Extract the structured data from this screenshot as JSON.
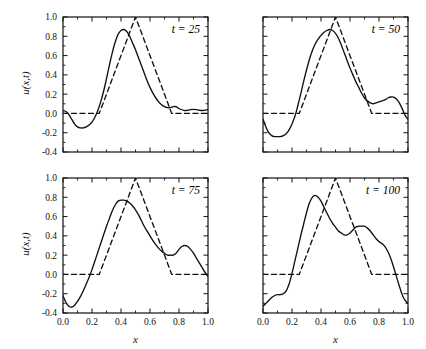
{
  "figure": {
    "axis_label_x": "x",
    "axis_label_y": "u(x,t)",
    "xticklabels": [
      "0.0",
      "0.2",
      "0.4",
      "0.6",
      "0.8",
      "1.0"
    ],
    "yticklabels": [
      "-0.4",
      "-0.2",
      "0.0",
      "0.2",
      "0.4",
      "0.6",
      "0.8",
      "1.0"
    ],
    "line_color": "#111111",
    "frame_color": "#111111",
    "background": "#ffffff"
  },
  "chart_data": {
    "type": "line",
    "title": "",
    "xlabel": "x",
    "ylabel": "u(x,t)",
    "xlim": [
      0.0,
      1.0
    ],
    "ylim": [
      -0.4,
      1.0
    ],
    "xticks": [
      0.0,
      0.2,
      0.4,
      0.6,
      0.8,
      1.0
    ],
    "yticks": [
      -0.4,
      -0.2,
      0.0,
      0.2,
      0.4,
      0.6,
      0.8,
      1.0
    ],
    "grid": false,
    "legend": null,
    "panels": [
      {
        "annotation": "t = 25",
        "position": "top-left",
        "series": [
          {
            "name": "numerical",
            "style": "solid",
            "x": [
              0.0,
              0.02,
              0.04,
              0.06,
              0.08,
              0.1,
              0.12,
              0.14,
              0.16,
              0.18,
              0.2,
              0.22,
              0.24,
              0.26,
              0.28,
              0.3,
              0.32,
              0.34,
              0.36,
              0.38,
              0.4,
              0.42,
              0.44,
              0.46,
              0.48,
              0.5,
              0.52,
              0.54,
              0.56,
              0.58,
              0.6,
              0.62,
              0.64,
              0.66,
              0.68,
              0.7,
              0.72,
              0.74,
              0.76,
              0.78,
              0.8,
              0.84,
              0.88,
              0.92,
              0.96,
              1.0
            ],
            "y": [
              0.03,
              0.02,
              -0.01,
              -0.06,
              -0.11,
              -0.14,
              -0.15,
              -0.15,
              -0.14,
              -0.12,
              -0.09,
              -0.04,
              0.03,
              0.12,
              0.23,
              0.36,
              0.5,
              0.63,
              0.74,
              0.82,
              0.86,
              0.87,
              0.85,
              0.8,
              0.73,
              0.66,
              0.58,
              0.5,
              0.42,
              0.34,
              0.27,
              0.21,
              0.16,
              0.12,
              0.09,
              0.07,
              0.06,
              0.06,
              0.07,
              0.07,
              0.05,
              0.03,
              0.04,
              0.04,
              0.03,
              0.04
            ]
          },
          {
            "name": "exact",
            "style": "dashed",
            "x": [
              0.0,
              0.25,
              0.5,
              0.75,
              1.0
            ],
            "y": [
              0.0,
              0.0,
              1.0,
              0.0,
              0.0
            ]
          }
        ]
      },
      {
        "annotation": "t = 50",
        "position": "top-right",
        "series": [
          {
            "name": "numerical",
            "style": "solid",
            "x": [
              0.0,
              0.02,
              0.04,
              0.06,
              0.08,
              0.1,
              0.12,
              0.14,
              0.16,
              0.18,
              0.2,
              0.22,
              0.24,
              0.26,
              0.28,
              0.3,
              0.32,
              0.34,
              0.36,
              0.38,
              0.4,
              0.42,
              0.44,
              0.46,
              0.48,
              0.5,
              0.52,
              0.54,
              0.56,
              0.58,
              0.6,
              0.62,
              0.64,
              0.66,
              0.68,
              0.7,
              0.72,
              0.74,
              0.76,
              0.78,
              0.8,
              0.82,
              0.84,
              0.86,
              0.88,
              0.9,
              0.92,
              0.94,
              0.96,
              0.98,
              1.0
            ],
            "y": [
              -0.06,
              -0.14,
              -0.2,
              -0.23,
              -0.24,
              -0.24,
              -0.24,
              -0.23,
              -0.21,
              -0.17,
              -0.11,
              -0.03,
              0.08,
              0.2,
              0.33,
              0.45,
              0.56,
              0.65,
              0.72,
              0.77,
              0.81,
              0.84,
              0.86,
              0.87,
              0.86,
              0.83,
              0.78,
              0.71,
              0.63,
              0.55,
              0.47,
              0.4,
              0.33,
              0.27,
              0.21,
              0.16,
              0.13,
              0.11,
              0.1,
              0.11,
              0.12,
              0.13,
              0.14,
              0.16,
              0.17,
              0.17,
              0.15,
              0.11,
              0.05,
              -0.02,
              -0.06
            ]
          },
          {
            "name": "exact",
            "style": "dashed",
            "x": [
              0.0,
              0.25,
              0.5,
              0.75,
              1.0
            ],
            "y": [
              0.0,
              0.0,
              1.0,
              0.0,
              0.0
            ]
          }
        ]
      },
      {
        "annotation": "t = 75",
        "position": "bottom-left",
        "series": [
          {
            "name": "numerical",
            "style": "solid",
            "x": [
              0.0,
              0.02,
              0.04,
              0.06,
              0.08,
              0.1,
              0.12,
              0.14,
              0.16,
              0.18,
              0.2,
              0.22,
              0.24,
              0.26,
              0.28,
              0.3,
              0.32,
              0.34,
              0.36,
              0.38,
              0.4,
              0.42,
              0.44,
              0.46,
              0.48,
              0.5,
              0.52,
              0.54,
              0.56,
              0.58,
              0.6,
              0.62,
              0.64,
              0.66,
              0.68,
              0.7,
              0.72,
              0.74,
              0.76,
              0.78,
              0.8,
              0.82,
              0.84,
              0.86,
              0.88,
              0.9,
              0.92,
              0.94,
              0.96,
              0.98,
              1.0
            ],
            "y": [
              -0.22,
              -0.29,
              -0.33,
              -0.34,
              -0.32,
              -0.28,
              -0.23,
              -0.17,
              -0.1,
              -0.03,
              0.05,
              0.14,
              0.23,
              0.32,
              0.41,
              0.5,
              0.58,
              0.66,
              0.72,
              0.76,
              0.77,
              0.77,
              0.76,
              0.74,
              0.71,
              0.67,
              0.62,
              0.56,
              0.5,
              0.45,
              0.4,
              0.35,
              0.31,
              0.27,
              0.24,
              0.22,
              0.2,
              0.2,
              0.2,
              0.22,
              0.26,
              0.29,
              0.3,
              0.29,
              0.26,
              0.22,
              0.17,
              0.12,
              0.07,
              0.02,
              -0.02
            ]
          },
          {
            "name": "exact",
            "style": "dashed",
            "x": [
              0.0,
              0.25,
              0.5,
              0.75,
              1.0
            ],
            "y": [
              0.0,
              0.0,
              1.0,
              0.0,
              0.0
            ]
          }
        ]
      },
      {
        "annotation": "t = 100",
        "position": "bottom-right",
        "series": [
          {
            "name": "numerical",
            "style": "solid",
            "x": [
              0.0,
              0.02,
              0.04,
              0.06,
              0.08,
              0.1,
              0.12,
              0.14,
              0.16,
              0.18,
              0.2,
              0.22,
              0.24,
              0.26,
              0.28,
              0.3,
              0.32,
              0.34,
              0.36,
              0.38,
              0.4,
              0.42,
              0.44,
              0.46,
              0.48,
              0.5,
              0.52,
              0.54,
              0.56,
              0.58,
              0.6,
              0.62,
              0.64,
              0.66,
              0.68,
              0.7,
              0.72,
              0.74,
              0.76,
              0.78,
              0.8,
              0.82,
              0.84,
              0.86,
              0.88,
              0.9,
              0.92,
              0.94,
              0.96,
              0.98,
              1.0
            ],
            "y": [
              -0.33,
              -0.3,
              -0.27,
              -0.24,
              -0.22,
              -0.21,
              -0.21,
              -0.2,
              -0.17,
              -0.1,
              0.01,
              0.14,
              0.27,
              0.4,
              0.52,
              0.64,
              0.74,
              0.8,
              0.82,
              0.8,
              0.76,
              0.7,
              0.64,
              0.58,
              0.53,
              0.49,
              0.45,
              0.43,
              0.41,
              0.41,
              0.43,
              0.46,
              0.49,
              0.5,
              0.5,
              0.5,
              0.48,
              0.45,
              0.41,
              0.37,
              0.34,
              0.32,
              0.29,
              0.24,
              0.17,
              0.08,
              -0.02,
              -0.12,
              -0.21,
              -0.27,
              -0.3
            ]
          },
          {
            "name": "exact",
            "style": "dashed",
            "x": [
              0.0,
              0.25,
              0.5,
              0.75,
              1.0
            ],
            "y": [
              0.0,
              0.0,
              1.0,
              0.0,
              0.0
            ]
          }
        ]
      }
    ]
  }
}
